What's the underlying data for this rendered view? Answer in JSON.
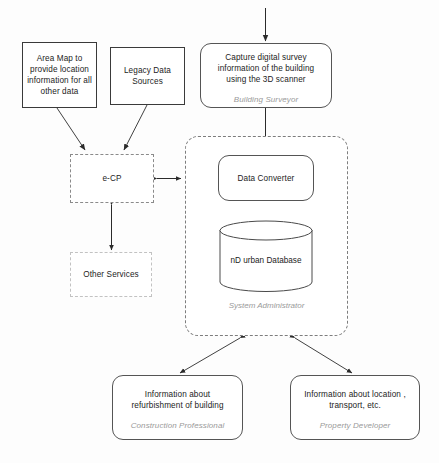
{
  "diagram": {
    "background_color": "#fdfdfd",
    "line_color": "#333333",
    "role_text_color": "#9a9a9a"
  },
  "nodes": {
    "area_map": {
      "label": "Area Map to provide location information for all other data",
      "shape": "rectangle",
      "border": "solid"
    },
    "legacy_data": {
      "label": "Legacy Data Sources",
      "shape": "rectangle",
      "border": "solid"
    },
    "capture_survey": {
      "label": "Capture digital survey information of the building using the 3D scanner",
      "role": "Building Surveyor",
      "shape": "rounded-rectangle",
      "border": "solid"
    },
    "ecp": {
      "label": "e-CP",
      "shape": "rectangle",
      "border": "dashed"
    },
    "other_services": {
      "label": "Other Services",
      "shape": "rectangle",
      "border": "dashed"
    },
    "data_converter": {
      "label": "Data Converter",
      "shape": "rounded-rectangle",
      "border": "solid"
    },
    "database": {
      "label": "nD urban Database",
      "shape": "cylinder",
      "border": "solid"
    },
    "system_group": {
      "role": "System Administrator",
      "shape": "rounded-rectangle",
      "border": "dashed"
    },
    "refurbishment_info": {
      "label": "Information about refurbishment of building",
      "role": "Construction Professional",
      "shape": "rounded-rectangle",
      "border": "solid"
    },
    "location_info": {
      "label": "Information about location , transport, etc.",
      "role": "Property Developer",
      "shape": "rounded-rectangle",
      "border": "solid"
    }
  },
  "connections": [
    {
      "name": "external-to-capture",
      "from": "external-source",
      "to": "capture_survey",
      "arrow": "single"
    },
    {
      "name": "area-map-to-ecp",
      "from": "area_map",
      "to": "ecp",
      "arrow": "single"
    },
    {
      "name": "legacy-to-ecp",
      "from": "legacy_data",
      "to": "ecp",
      "arrow": "single"
    },
    {
      "name": "capture-to-converter",
      "from": "capture_survey",
      "to": "data_converter",
      "arrow": "single"
    },
    {
      "name": "ecp-to-system",
      "from": "ecp",
      "to": "system_group",
      "arrow": "double"
    },
    {
      "name": "ecp-to-other-services",
      "from": "ecp",
      "to": "other_services",
      "arrow": "double"
    },
    {
      "name": "converter-to-database",
      "from": "data_converter",
      "to": "database",
      "arrow": "double"
    },
    {
      "name": "system-to-refurbishment",
      "from": "system_group",
      "to": "refurbishment_info",
      "arrow": "double"
    },
    {
      "name": "system-to-location",
      "from": "system_group",
      "to": "location_info",
      "arrow": "double"
    }
  ]
}
